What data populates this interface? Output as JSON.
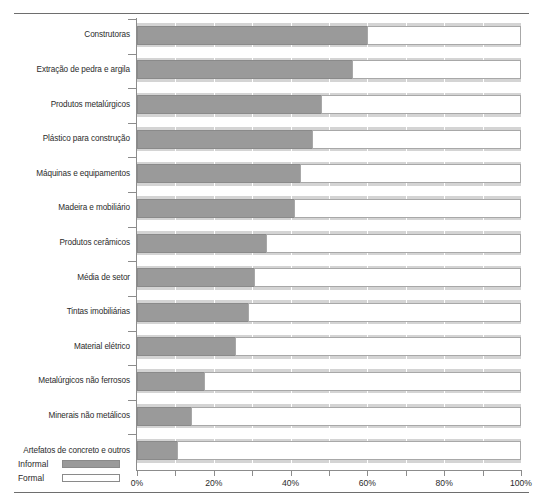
{
  "chart_data": {
    "type": "bar",
    "orientation": "horizontal",
    "stacked": true,
    "title": "",
    "subtitle": "",
    "xlabel": "",
    "ylabel": "",
    "xlim": [
      0,
      100
    ],
    "xticks": [
      0,
      10,
      20,
      30,
      40,
      50,
      60,
      70,
      80,
      90,
      100
    ],
    "xtick_labels": [
      "0%",
      "",
      "20%",
      "",
      "40%",
      "",
      "60%",
      "",
      "80%",
      "",
      "100%"
    ],
    "xtick_labels_shown": [
      "0%",
      "20%",
      "40%",
      "60%",
      "80%",
      "100%"
    ],
    "grid": true,
    "grid_axis": "x",
    "legend_position": "bottom-left",
    "categories": [
      "Construtoras",
      "Extração de pedra e argila",
      "Produtos metalúrgicos",
      "Plástico para construção",
      "Máquinas e equipamentos",
      "Madeira e mobiliário",
      "Produtos cerâmicos",
      "Média de setor",
      "Tintas imobiliárias",
      "Material elétrico",
      "Metalúrgicos não ferrosos",
      "Minerais não metálicos",
      "Artefatos de concreto e outros"
    ],
    "series": [
      {
        "name": "Informal",
        "color": "#9a9a9a",
        "values": [
          60,
          56,
          48,
          45.5,
          42.5,
          41,
          33.5,
          30.5,
          29,
          25.5,
          17.5,
          14,
          10.5
        ]
      },
      {
        "name": "Formal",
        "color": "#ffffff",
        "values": [
          40,
          44,
          52,
          54.5,
          57.5,
          59,
          66.5,
          69.5,
          71,
          74.5,
          82.5,
          86,
          89.5
        ]
      }
    ],
    "annotations": []
  },
  "legend": {
    "items": [
      {
        "label": "Informal",
        "swatch": "informal-swatch"
      },
      {
        "label": "Formal",
        "swatch": "formal-swatch"
      }
    ]
  }
}
